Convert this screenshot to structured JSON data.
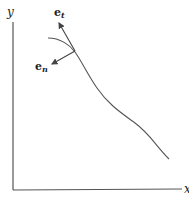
{
  "diagram": {
    "axes": {
      "x_label": "x",
      "y_label": "y"
    },
    "vectors": [
      {
        "name": "tangent",
        "symbol": "e",
        "subscript": "t"
      },
      {
        "name": "normal",
        "symbol": "e",
        "subscript": "n"
      }
    ],
    "colors": {
      "line": "#555555",
      "text": "#222222",
      "background": "#ffffff"
    }
  }
}
